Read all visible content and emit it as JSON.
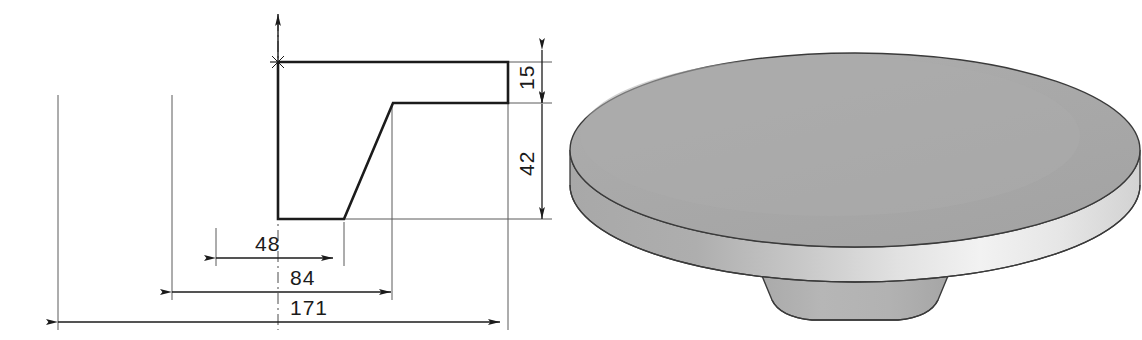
{
  "drawing": {
    "type": "engineering-drawing",
    "units_note": "",
    "views": [
      "section-profile",
      "isometric-solid"
    ],
    "line_color": "#1b1b1b",
    "thin_line_color": "#4a4a4a",
    "background": "#ffffff"
  },
  "profile_view": {
    "name": "revolve-section-profile",
    "outline_points": "278,62 508,62 508,103 393,103 344,219 278,219",
    "axis_marker": "origin-cross",
    "description": "Half section profile of a revolved mushroom knob"
  },
  "dimensions": [
    {
      "id": "dim-48",
      "value": "48",
      "orientation": "horizontal",
      "x1": 216,
      "x2": 333,
      "y": 258,
      "label_x": 281,
      "label_y": 250
    },
    {
      "id": "dim-84",
      "value": "84",
      "orientation": "horizontal",
      "x1": 172,
      "x2": 391,
      "y": 292,
      "label_x": 315,
      "label_y": 284
    },
    {
      "id": "dim-171",
      "value": "171",
      "orientation": "horizontal",
      "x1": 58,
      "x2": 500,
      "y": 322,
      "label_x": 290,
      "label_y": 314
    },
    {
      "id": "dim-15",
      "value": "15",
      "orientation": "vertical",
      "y1": 50,
      "y2": 103,
      "x": 542,
      "label_x": 532,
      "label_y": 77
    },
    {
      "id": "dim-42",
      "value": "42",
      "orientation": "vertical",
      "y1": 104,
      "y2": 219,
      "x": 542,
      "label_x": 532,
      "label_y": 162
    }
  ],
  "extension_lines": [
    {
      "id": "ext-left-171",
      "x": 58,
      "y1": 95,
      "y2": 330
    },
    {
      "id": "ext-left-84",
      "x": 172,
      "y1": 95,
      "y2": 300
    },
    {
      "id": "ext-left-48",
      "x": 216,
      "y1": 228,
      "y2": 266
    },
    {
      "id": "ext-dia-foot",
      "x": 344,
      "y1": 219,
      "y2": 266
    },
    {
      "id": "ext-ledge",
      "x": 392,
      "y1": 104,
      "y2": 300
    },
    {
      "id": "ext-right",
      "x": 508,
      "y1": 62,
      "y2": 330
    }
  ],
  "solid_view": {
    "name": "isometric-knob-solid",
    "description": "Revolved disc with tapered conical stem",
    "colors": {
      "top_face": "#a9a9a9",
      "rim_shadow": "#a9a9a9",
      "rim_highlight": "#e8e8e8",
      "stem_face": "#b2b2b2",
      "edge": "#3a3a3a"
    },
    "disc": {
      "cx": 855,
      "cy": 150,
      "rx": 285,
      "ry": 97,
      "thickness": 52
    },
    "stem": {
      "top_half_width": 112,
      "bottom_half_width": 78,
      "top_y": 232,
      "bottom_y": 318
    }
  }
}
